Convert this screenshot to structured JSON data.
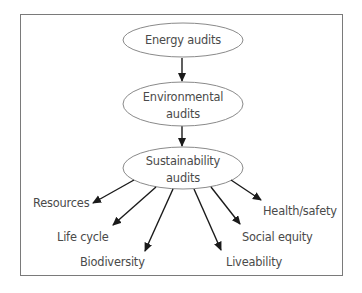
{
  "diagram": {
    "type": "flowchart",
    "nodes": {
      "energy": {
        "lines": [
          "Energy audits"
        ],
        "cx": 183,
        "cy": 40,
        "rx": 60,
        "ry": 17
      },
      "environmental": {
        "lines": [
          "Environmental",
          "audits"
        ],
        "cx": 183,
        "cy": 104,
        "rx": 60,
        "ry": 22
      },
      "sustainability": {
        "lines": [
          "Sustainability",
          "audits"
        ],
        "cx": 183,
        "cy": 168,
        "rx": 60,
        "ry": 21
      }
    },
    "leaves": [
      {
        "label": "Resources",
        "x": 33,
        "y": 208
      },
      {
        "label": "Life cycle",
        "x": 57,
        "y": 242
      },
      {
        "label": "Biodiversity",
        "x": 80,
        "y": 266
      },
      {
        "label": "Liveability",
        "x": 226,
        "y": 266
      },
      {
        "label": "Social equity",
        "x": 242,
        "y": 241
      },
      {
        "label": "Health/safety",
        "x": 263,
        "y": 216
      }
    ],
    "edges": [
      {
        "from": "Energy audits",
        "to": "Environmental audits"
      },
      {
        "from": "Environmental audits",
        "to": "Sustainability audits"
      },
      {
        "from": "Sustainability audits",
        "to": "Resources"
      },
      {
        "from": "Sustainability audits",
        "to": "Life cycle"
      },
      {
        "from": "Sustainability audits",
        "to": "Biodiversity"
      },
      {
        "from": "Sustainability audits",
        "to": "Liveability"
      },
      {
        "from": "Sustainability audits",
        "to": "Social equity"
      },
      {
        "from": "Sustainability audits",
        "to": "Health/safety"
      }
    ],
    "colors": {
      "frame": "#7a7a7a",
      "ellipse_stroke": "#8a8a8a",
      "text": "#4a4a4a",
      "arrow": "#1a1a1a"
    }
  }
}
